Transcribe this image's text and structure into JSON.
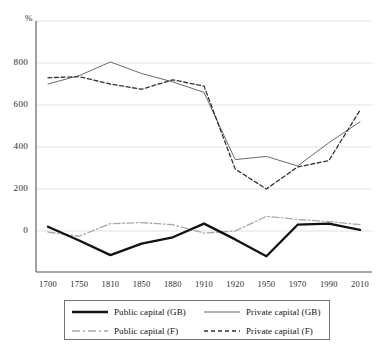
{
  "figure": {
    "y_axis_unit": "%",
    "caption_fragment": ""
  },
  "legend": {
    "entries": [
      {
        "label": "Public capital (GB)",
        "style": "solid-thick",
        "color": "#111111"
      },
      {
        "label": "Private capital (GB)",
        "style": "solid-thin",
        "color": "#6b6b6b"
      },
      {
        "label": "Public capital (F)",
        "style": "dash-dot",
        "color": "#a8a8a8"
      },
      {
        "label": "Private capital (F)",
        "style": "dashed",
        "color": "#333333"
      }
    ]
  },
  "chart_data": {
    "type": "line",
    "title": "",
    "xlabel": "",
    "ylabel": "%",
    "ylim": [
      -200,
      1000
    ],
    "yticks": [
      0,
      200,
      400,
      600,
      800
    ],
    "ytick_labels": [
      "0",
      "200",
      "400",
      "600",
      "800"
    ],
    "grid": true,
    "legend_position": "bottom",
    "categories": [
      "1700",
      "1750",
      "1810",
      "1850",
      "1880",
      "1910",
      "1920",
      "1950",
      "1970",
      "1990",
      "2010"
    ],
    "series": [
      {
        "name": "Public capital (GB)",
        "color": "#111111",
        "style": "solid-thick",
        "values": [
          20,
          -45,
          -115,
          -60,
          -30,
          35,
          -40,
          -120,
          30,
          35,
          5
        ]
      },
      {
        "name": "Private capital (GB)",
        "color": "#6b6b6b",
        "style": "solid-thin",
        "values": [
          700,
          740,
          805,
          750,
          710,
          660,
          340,
          355,
          310,
          420,
          520
        ]
      },
      {
        "name": "Public capital (F)",
        "color": "#a8a8a8",
        "style": "dash-dot",
        "values": [
          -5,
          -25,
          35,
          40,
          30,
          -10,
          0,
          70,
          55,
          45,
          30
        ]
      },
      {
        "name": "Private capital (F)",
        "color": "#333333",
        "style": "dashed",
        "values": [
          730,
          735,
          700,
          675,
          720,
          690,
          295,
          200,
          305,
          335,
          575
        ]
      }
    ]
  }
}
